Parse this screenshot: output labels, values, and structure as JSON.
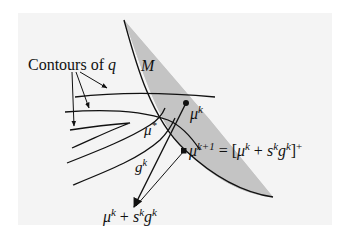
{
  "diagram": {
    "labels": {
      "contours": {
        "text": "Contours of ",
        "var": "q"
      },
      "set": "M",
      "mu_k": {
        "base": "μ",
        "sup": "k"
      },
      "mu_star": {
        "base": "μ",
        "sup": "*"
      },
      "g_k": {
        "base": "g",
        "sup": "k"
      },
      "mu_k1": {
        "base": "μ",
        "sup": "k+1",
        "eq": " = [",
        "mu": "μ",
        "musup": "k",
        "plus": " + ",
        "s": "s",
        "ssup": "k",
        "g": "g",
        "gsup": "k",
        "close": "]",
        "closesup": "+"
      },
      "step_point": {
        "mu": "μ",
        "musup": "k",
        "plus": " + ",
        "s": "s",
        "ssup": "k",
        "g": "g",
        "gsup": "k"
      }
    },
    "colors": {
      "background": "#f4f4f4",
      "shaded_set": "#c4c4c4",
      "stroke": "#111111"
    }
  }
}
